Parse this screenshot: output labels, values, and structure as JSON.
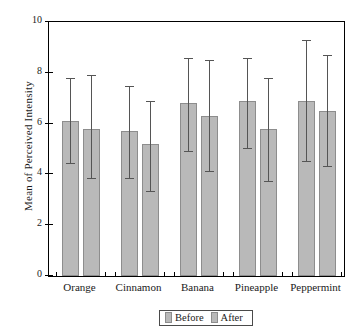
{
  "chart_data": {
    "type": "bar",
    "title": "",
    "xlabel": "",
    "ylabel": "Mean of Perceived Intensity",
    "ylim": [
      0,
      10
    ],
    "yticks": [
      0,
      2,
      4,
      6,
      8,
      10
    ],
    "ytick_labels": [
      "0",
      "2",
      "4",
      "6",
      "8",
      "10"
    ],
    "grid": false,
    "legend_position": "bottom-center",
    "categories": [
      "Orange",
      "Cinnamon",
      "Banana",
      "Pineapple",
      "Peppermint"
    ],
    "series": [
      {
        "name": "Before",
        "values": [
          6.1,
          5.7,
          6.8,
          6.9,
          6.9
        ],
        "err_low": [
          4.4,
          3.8,
          4.9,
          5.0,
          4.5
        ],
        "err_high": [
          7.8,
          7.5,
          8.6,
          8.6,
          9.3
        ]
      },
      {
        "name": "After",
        "values": [
          5.8,
          5.2,
          6.3,
          5.8,
          6.5
        ],
        "err_low": [
          3.8,
          3.3,
          4.1,
          3.7,
          4.3
        ],
        "err_high": [
          7.9,
          6.9,
          8.5,
          7.8,
          8.7
        ]
      }
    ]
  },
  "legend": {
    "items": [
      {
        "label": "Before"
      },
      {
        "label": "After"
      }
    ]
  }
}
